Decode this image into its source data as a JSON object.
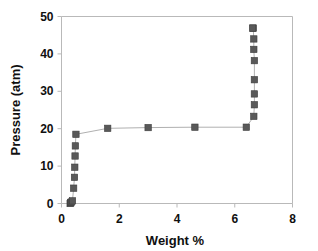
{
  "chart_data": {
    "type": "scatter",
    "title": "",
    "xlabel": "Weight %",
    "ylabel": "Pressure (atm)",
    "xlim": [
      0,
      8
    ],
    "ylim": [
      0,
      50
    ],
    "xticks": [
      0,
      2,
      4,
      6,
      8
    ],
    "yticks": [
      0,
      10,
      20,
      30,
      40,
      50
    ],
    "xtick_labels": [
      "0",
      "2",
      "4",
      "6",
      "8"
    ],
    "ytick_labels": [
      "0",
      "10",
      "20",
      "30",
      "40",
      "50"
    ],
    "grid": false,
    "legend": null,
    "marker": "square",
    "marker_color": "#595959",
    "line_color": "#b0b0b0",
    "series": [
      {
        "name": "isotherm",
        "x": [
          0.3,
          0.32,
          0.34,
          0.38,
          0.42,
          0.45,
          0.46,
          0.47,
          0.48,
          0.5,
          1.6,
          3.0,
          4.62,
          6.4,
          6.66,
          6.68,
          6.68,
          6.68,
          6.68,
          6.66,
          6.66,
          6.64,
          6.62
        ],
        "y": [
          0.0,
          0.2,
          0.4,
          0.7,
          4.1,
          7.0,
          9.7,
          12.7,
          15.4,
          18.5,
          20.1,
          20.3,
          20.4,
          20.4,
          23.3,
          26.4,
          29.3,
          33.1,
          38.2,
          41.2,
          44.0,
          46.9,
          46.9
        ]
      }
    ]
  },
  "axes": {
    "y_title": "Pressure (atm)",
    "x_title": "Weight %"
  }
}
